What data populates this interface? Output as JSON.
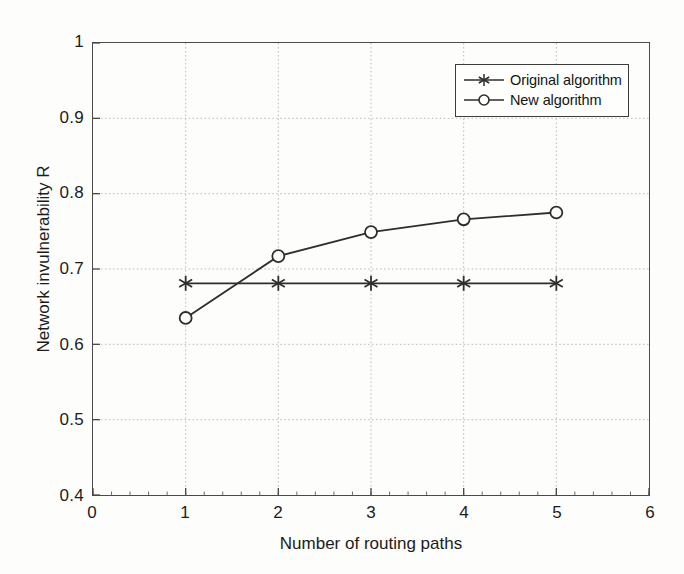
{
  "chart_data": {
    "type": "line",
    "title": "",
    "xlabel": "Number of routing paths",
    "ylabel": "Network invulnerability R",
    "x": [
      1,
      2,
      3,
      4,
      5
    ],
    "xlim": [
      0,
      6
    ],
    "ylim": [
      0.4,
      1
    ],
    "xticks": [
      "0",
      "1",
      "2",
      "3",
      "4",
      "5",
      "6"
    ],
    "xtick_values": [
      0,
      1,
      2,
      3,
      4,
      5,
      6
    ],
    "yticks": [
      "0.4",
      "0.5",
      "0.6",
      "0.7",
      "0.8",
      "0.9",
      "1"
    ],
    "ytick_values": [
      0.4,
      0.5,
      0.6,
      0.7,
      0.8,
      0.9,
      1
    ],
    "grid": true,
    "legend_position": "top-right",
    "series": [
      {
        "name": "Original algorithm",
        "marker": "asterisk",
        "color": "#2e2e2e",
        "values": [
          0.681,
          0.681,
          0.681,
          0.681,
          0.681
        ]
      },
      {
        "name": "New algorithm",
        "marker": "circle",
        "color": "#2e2e2e",
        "values": [
          0.635,
          0.717,
          0.749,
          0.766,
          0.775
        ]
      }
    ]
  },
  "legend": {
    "entries": [
      {
        "label": "Original algorithm"
      },
      {
        "label": "New algorithm"
      }
    ]
  },
  "axes": {
    "x_title": "Number of routing paths",
    "y_title": "Network invulnerability R"
  },
  "colors": {
    "axis": "#4a4a4a",
    "grid": "#b9b9b9",
    "line": "#2e2e2e",
    "background": "#fdfdfb"
  }
}
